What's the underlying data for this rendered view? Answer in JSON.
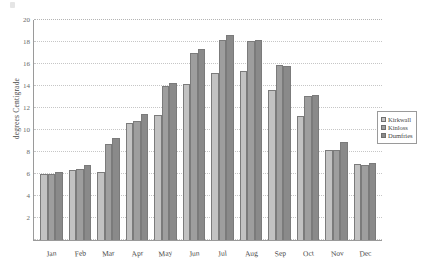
{
  "chart_data": {
    "type": "bar",
    "title": "",
    "xlabel": "",
    "ylabel": "degrees Centigrade",
    "ylim": [
      0,
      20
    ],
    "yticks": [
      0,
      2,
      4,
      6,
      8,
      10,
      12,
      14,
      16,
      18,
      20
    ],
    "ytick_labels": [
      "",
      "2",
      "4",
      "6",
      "8",
      "10",
      "12",
      "14",
      "16",
      "18",
      "20"
    ],
    "grid": true,
    "legend_position": "right",
    "categories": [
      "Jan",
      "Feb",
      "Mar",
      "Apr",
      "May",
      "Jun",
      "Jul",
      "Aug",
      "Sep",
      "Oct",
      "Nov",
      "Dec"
    ],
    "series": [
      {
        "name": "Kirkwall",
        "color": "#c2c2c2",
        "values": [
          6.0,
          6.4,
          6.2,
          10.6,
          11.4,
          14.2,
          15.2,
          15.4,
          13.6,
          11.3,
          8.2,
          6.9
        ]
      },
      {
        "name": "Kinloss",
        "color": "#9e9e9e",
        "values": [
          6.0,
          6.5,
          8.7,
          10.8,
          14.0,
          17.0,
          18.2,
          18.1,
          15.9,
          13.1,
          8.2,
          6.8
        ]
      },
      {
        "name": "Dumfries",
        "color": "#8a8a8a",
        "values": [
          6.2,
          6.8,
          9.3,
          11.5,
          14.3,
          17.4,
          18.6,
          18.2,
          15.8,
          13.2,
          8.9,
          7.0
        ]
      }
    ]
  },
  "legend": {
    "items": [
      {
        "label": "Kirkwall"
      },
      {
        "label": "Kinloss"
      },
      {
        "label": "Dumfries"
      }
    ]
  }
}
